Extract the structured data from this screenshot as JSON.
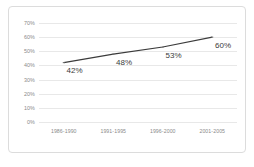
{
  "chart_data": {
    "type": "line",
    "title": "",
    "xlabel": "",
    "ylabel": "",
    "categories": [
      "1986-1990",
      "1991-1995",
      "1996-2000",
      "2001-2005"
    ],
    "values": [
      42,
      48,
      53,
      60
    ],
    "point_labels": [
      "42%",
      "48%",
      "53%",
      "60%"
    ],
    "ylim": [
      0,
      70
    ],
    "yticks": [
      0,
      10,
      20,
      30,
      40,
      50,
      60,
      70
    ],
    "ytick_labels": [
      "0%",
      "10%",
      "20%",
      "30%",
      "40%",
      "50%",
      "60%",
      "70%"
    ],
    "grid": "horizontal",
    "legend": "none",
    "series": [
      {
        "name": "",
        "values": [
          42,
          48,
          53,
          60
        ],
        "line_color": "#3b3b3b",
        "marker": "square",
        "marker_color": "#6e6e6e"
      }
    ]
  },
  "style": {
    "border_color": "#dcdcdc",
    "gridline_color": "#e8e8e8",
    "tick_text_color": "#8a8a8a",
    "label_text_color": "#3b3b3b",
    "background": "#ffffff"
  }
}
